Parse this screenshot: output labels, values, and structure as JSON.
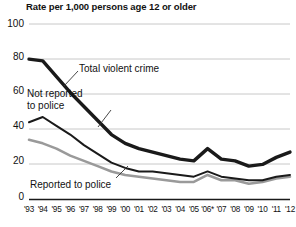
{
  "chart_data": {
    "type": "line",
    "title": "Rate per 1,000 persons age 12 or older",
    "xlabel": "",
    "ylabel": "Rate per 1,000 persons age 12 or older",
    "ylim": [
      0,
      100
    ],
    "yticks": [
      0,
      20,
      40,
      60,
      80,
      100
    ],
    "grid": true,
    "legend_position": "inline-annotations",
    "x": [
      "'93",
      "'94",
      "'95",
      "'96",
      "'97",
      "'98",
      "'99",
      "'00",
      "'01",
      "'02",
      "'03",
      "'04",
      "'05",
      "'06*",
      "'07",
      "'08",
      "'09",
      "'10",
      "'11",
      "'12"
    ],
    "categories": [
      "'93",
      "'94",
      "'95",
      "'96",
      "'97",
      "'98",
      "'99",
      "'00",
      "'01",
      "'02",
      "'03",
      "'04",
      "'05",
      "'06*",
      "'07",
      "'08",
      "'09",
      "'10",
      "'11",
      "'12"
    ],
    "annotations": [
      "* Due to methodological changes in the 2006 National Crime Victimization Survey, use caution when comparing 2006 criminal victimization estimates to other years."
    ],
    "series": [
      {
        "name": "Total violent crime",
        "color": "#1a1a1a",
        "width": 3.4,
        "values": [
          80,
          79,
          70,
          61,
          53,
          45,
          37,
          32,
          29,
          27,
          25,
          23,
          22,
          29,
          23,
          22,
          19,
          20,
          24,
          27
        ]
      },
      {
        "name": "Not reported to police",
        "color": "#1a1a1a",
        "width": 2.0,
        "values": [
          44,
          47,
          42,
          37,
          31,
          26,
          21,
          18,
          16,
          16,
          15,
          14,
          13,
          16,
          13,
          12,
          11,
          11,
          13,
          14
        ]
      },
      {
        "name": "Reported to police",
        "color": "#9a9a9a",
        "width": 2.6,
        "values": [
          34,
          32,
          29,
          25,
          22,
          19,
          16,
          14,
          13,
          12,
          11,
          10,
          10,
          14,
          11,
          11,
          9,
          10,
          12,
          13
        ]
      }
    ]
  },
  "labels": {
    "total": "Total violent crime",
    "not_reported_line1": "Not reported",
    "not_reported_line2": "to police",
    "reported": "Reported to police"
  },
  "yticks": {
    "t0": "0",
    "t20": "20",
    "t40": "40",
    "t60": "60",
    "t80": "80",
    "t100": "100"
  }
}
